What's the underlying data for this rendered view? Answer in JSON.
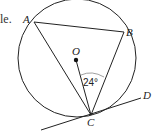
{
  "cut_text": "le.",
  "points": {
    "A": "A",
    "B": "B",
    "C": "C",
    "D": "D",
    "O": "O"
  },
  "angle_label": "24°",
  "colors": {
    "stroke": "#222222",
    "arc": "#888888"
  }
}
